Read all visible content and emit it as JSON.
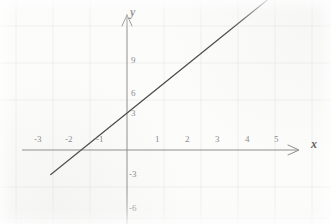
{
  "chart_data": {
    "type": "line",
    "title": "",
    "xlabel": "x",
    "ylabel": "y",
    "equation": "y = 2x + 3",
    "slope": 2,
    "y_intercept": 3,
    "x_intercept": -1.5,
    "x": [
      -2.5,
      6.5
    ],
    "values": [
      -2,
      16
    ],
    "series": [
      {
        "name": "y = 2x + 3",
        "points": [
          [
            -2.5,
            -2
          ],
          [
            -1.5,
            0
          ],
          [
            0,
            3
          ],
          [
            1,
            5
          ],
          [
            2,
            7
          ],
          [
            3,
            9
          ],
          [
            6.5,
            16
          ]
        ],
        "color": "#4a4a4a"
      }
    ],
    "xlim": [
      -3.8,
      6.9
    ],
    "ylim": [
      -7.5,
      16.5
    ],
    "xticks": [
      -3,
      -2,
      -1,
      1,
      2,
      3,
      4,
      5
    ],
    "yticks": [
      9,
      6,
      3,
      -3,
      -6
    ],
    "xtick_labels": [
      "-3",
      "-2",
      "-1",
      "1",
      "2",
      "3",
      "4",
      "5"
    ],
    "ytick_labels": [
      "9",
      "6",
      "3",
      "-3",
      "-6"
    ],
    "grid": true,
    "grid_color": "#e6e6e6",
    "axis_color": "#8e8e8e",
    "legend": "none",
    "annotations": []
  },
  "axes": {
    "x_axis_label": "x",
    "y_axis_label": "y",
    "x_arrow": "arrow-right",
    "y_arrow": "arrow-up",
    "origin_label": ""
  },
  "ticks": {
    "x": [
      {
        "label": "-3",
        "value": -3,
        "px": 39,
        "py": 140
      },
      {
        "label": "-2",
        "value": -2,
        "px": 70,
        "py": 140
      },
      {
        "label": "-1",
        "value": -1,
        "px": 101,
        "py": 140
      },
      {
        "label": "1",
        "value": 1,
        "px": 157,
        "py": 140
      },
      {
        "label": "2",
        "value": 2,
        "px": 188,
        "py": 140
      },
      {
        "label": "3",
        "value": 3,
        "px": 218,
        "py": 140
      },
      {
        "label": "4",
        "value": 4,
        "px": 247,
        "py": 140
      },
      {
        "label": "5",
        "value": 5,
        "px": 277,
        "py": 140
      }
    ],
    "y": [
      {
        "label": "9",
        "value": 9,
        "px": 131,
        "py": 58
      },
      {
        "label": "6",
        "value": 6,
        "px": 131,
        "py": 90
      },
      {
        "label": "3",
        "value": 3,
        "px": 131,
        "py": 112
      },
      {
        "label": "-3",
        "value": -3,
        "px": 129,
        "py": 173
      },
      {
        "label": "-6",
        "value": -6,
        "px": 129,
        "py": 207
      }
    ]
  },
  "colors": {
    "line": "#4a4a4a",
    "axis": "#8e8e8e",
    "grid": "#ececec",
    "tick_text": "#8b8b8b",
    "axis_text": "#5d5d5d",
    "background": "#fcfcfb"
  }
}
